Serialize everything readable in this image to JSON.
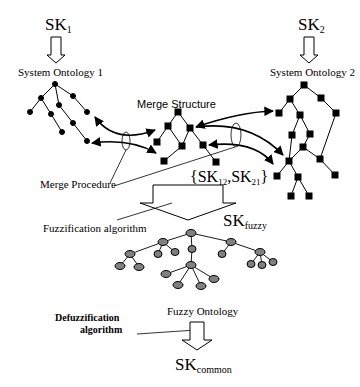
{
  "labels": {
    "sk1": {
      "base": "SK",
      "sub": "1"
    },
    "sk2": {
      "base": "SK",
      "sub": "2"
    },
    "system_ontology_1": "System Ontology 1",
    "system_ontology_2": "System Ontology 2",
    "merge_structure": "Merge Structure",
    "merge_procedure": "Merge Procedure",
    "sk12_sk21": {
      "open": "{",
      "a_base": "SK",
      "a_sub": "12",
      "sep": ",",
      "b_base": "SK",
      "b_sub": "21",
      "close": "}"
    },
    "fuzzification_algorithm": "Fuzzification algorithm",
    "sk_fuzzy": {
      "base": "SK",
      "sub": "fuzzy"
    },
    "fuzzy_ontology": "Fuzzy Ontology",
    "defuzzification_line1": "Defuzzification",
    "defuzzification_line2": "algorithm",
    "sk_common": {
      "base": "SK",
      "sub": "common"
    }
  },
  "colors": {
    "line": "#000000",
    "node_fill": "#000000",
    "fuzzy_node_fill": "#808080",
    "background": "#ffffff"
  }
}
